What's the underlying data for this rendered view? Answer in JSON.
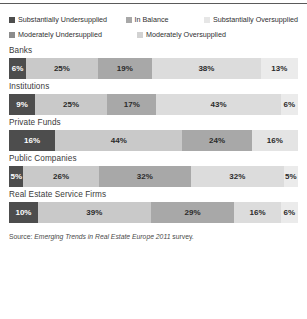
{
  "legend": {
    "rows": [
      [
        {
          "label": "Substantially Undersupplied",
          "color": "#4d4d4d"
        },
        {
          "label": "In Balance",
          "color": "#a8a8a8"
        },
        {
          "label": "Substantially Oversupplied",
          "color": "#e6e6e6"
        }
      ],
      [
        {
          "label": "Moderately Undersupplied",
          "color": "#8c8c8c"
        },
        {
          "label": "Moderately Oversupplied",
          "color": "#d2d2d2"
        }
      ]
    ]
  },
  "source": {
    "prefix": "Source: ",
    "title": "Emerging Trends in Real Estate Europe 2011",
    "suffix": " survey."
  },
  "chart_data": {
    "type": "bar",
    "subtype": "stacked-horizontal-100",
    "title": "",
    "xlabel": "",
    "ylabel": "",
    "xlim": [
      0,
      100
    ],
    "grid": false,
    "legend_position": "top",
    "value_suffix": "%",
    "categories": [
      "Banks",
      "Institutions",
      "Private Funds",
      "Public Companies",
      "Real Estate Service Firms"
    ],
    "series": [
      {
        "name": "Substantially Undersupplied",
        "color": "#4d4d4d",
        "text_color": "#ffffff",
        "values": [
          6,
          9,
          16,
          5,
          10
        ]
      },
      {
        "name": "Moderately Undersupplied",
        "color": "#c9c9c9",
        "text_color": "#2b2b2b",
        "values": [
          25,
          25,
          44,
          26,
          39
        ]
      },
      {
        "name": "In Balance",
        "color": "#a8a8a8",
        "text_color": "#2b2b2b",
        "values": [
          19,
          17,
          24,
          32,
          29
        ]
      },
      {
        "name": "Moderately Oversupplied",
        "color": "#dcdcdc",
        "text_color": "#2b2b2b",
        "values": [
          38,
          43,
          16,
          32,
          16
        ]
      },
      {
        "name": "Substantially Oversupplied",
        "color": "#ebebeb",
        "text_color": "#2b2b2b",
        "values": [
          13,
          6,
          0,
          5,
          6
        ]
      }
    ],
    "rows": [
      {
        "category": "Banks",
        "segments": [
          {
            "label": "6%",
            "value": 6,
            "series": "Substantially Undersupplied",
            "color": "#4d4d4d",
            "dark": true
          },
          {
            "label": "25%",
            "value": 25,
            "series": "Moderately Undersupplied",
            "color": "#c9c9c9",
            "dark": false
          },
          {
            "label": "19%",
            "value": 19,
            "series": "In Balance",
            "color": "#a8a8a8",
            "dark": false
          },
          {
            "label": "38%",
            "value": 38,
            "series": "Moderately Oversupplied",
            "color": "#dcdcdc",
            "dark": false
          },
          {
            "label": "13%",
            "value": 13,
            "series": "Substantially Oversupplied",
            "color": "#ebebeb",
            "dark": false
          }
        ]
      },
      {
        "category": "Institutions",
        "segments": [
          {
            "label": "9%",
            "value": 9,
            "series": "Substantially Undersupplied",
            "color": "#4d4d4d",
            "dark": true
          },
          {
            "label": "25%",
            "value": 25,
            "series": "Moderately Undersupplied",
            "color": "#c9c9c9",
            "dark": false
          },
          {
            "label": "17%",
            "value": 17,
            "series": "In Balance",
            "color": "#a8a8a8",
            "dark": false
          },
          {
            "label": "43%",
            "value": 43,
            "series": "Moderately Oversupplied",
            "color": "#dcdcdc",
            "dark": false
          },
          {
            "label": "6%",
            "value": 6,
            "series": "Substantially Oversupplied",
            "color": "#ebebeb",
            "dark": false
          }
        ]
      },
      {
        "category": "Private Funds",
        "segments": [
          {
            "label": "16%",
            "value": 16,
            "series": "Substantially Undersupplied",
            "color": "#4d4d4d",
            "dark": true
          },
          {
            "label": "44%",
            "value": 44,
            "series": "Moderately Undersupplied",
            "color": "#c9c9c9",
            "dark": false
          },
          {
            "label": "24%",
            "value": 24,
            "series": "In Balance",
            "color": "#a8a8a8",
            "dark": false
          },
          {
            "label": "16%",
            "value": 16,
            "series": "Moderately Oversupplied",
            "color": "#e4e4e4",
            "dark": false
          }
        ]
      },
      {
        "category": "Public Companies",
        "segments": [
          {
            "label": "5%",
            "value": 5,
            "series": "Substantially Undersupplied",
            "color": "#4d4d4d",
            "dark": true
          },
          {
            "label": "26%",
            "value": 26,
            "series": "Moderately Undersupplied",
            "color": "#c9c9c9",
            "dark": false
          },
          {
            "label": "32%",
            "value": 32,
            "series": "In Balance",
            "color": "#a8a8a8",
            "dark": false
          },
          {
            "label": "32%",
            "value": 32,
            "series": "Moderately Oversupplied",
            "color": "#dcdcdc",
            "dark": false
          },
          {
            "label": "5%",
            "value": 5,
            "series": "Substantially Oversupplied",
            "color": "#ebebeb",
            "dark": false
          }
        ]
      },
      {
        "category": "Real Estate Service Firms",
        "segments": [
          {
            "label": "10%",
            "value": 10,
            "series": "Substantially Undersupplied",
            "color": "#4d4d4d",
            "dark": true
          },
          {
            "label": "39%",
            "value": 39,
            "series": "Moderately Undersupplied",
            "color": "#c9c9c9",
            "dark": false
          },
          {
            "label": "29%",
            "value": 29,
            "series": "In Balance",
            "color": "#a8a8a8",
            "dark": false
          },
          {
            "label": "16%",
            "value": 16,
            "series": "Moderately Oversupplied",
            "color": "#dcdcdc",
            "dark": false
          },
          {
            "label": "6%",
            "value": 6,
            "series": "Substantially Oversupplied",
            "color": "#ebebeb",
            "dark": false
          }
        ]
      }
    ]
  }
}
